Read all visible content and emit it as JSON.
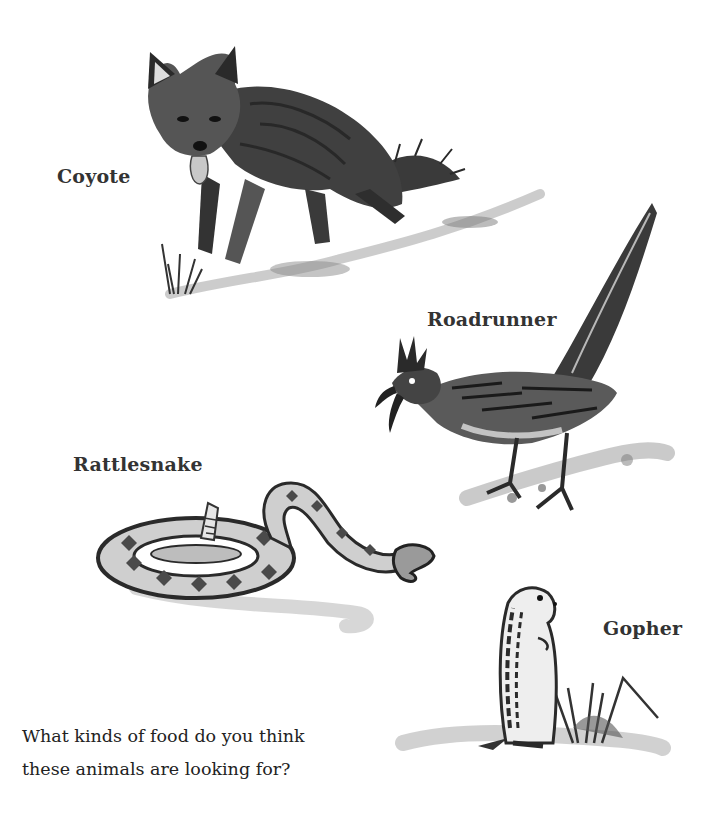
{
  "page": {
    "labels": {
      "coyote": "Coyote",
      "roadrunner": "Roadrunner",
      "rattlesnake": "Rattlesnake",
      "gopher": "Gopher"
    },
    "question": {
      "line1": "What kinds of food do you think",
      "line2": "these animals are looking for?"
    },
    "illustrations": [
      {
        "name": "coyote",
        "icon": "coyote-sketch-icon"
      },
      {
        "name": "roadrunner",
        "icon": "roadrunner-sketch-icon"
      },
      {
        "name": "rattlesnake",
        "icon": "rattlesnake-sketch-icon"
      },
      {
        "name": "gopher",
        "icon": "gopher-sketch-icon"
      }
    ],
    "colors": {
      "ink": "#2a2a2a",
      "shade": "#6b6b6b",
      "light_shade": "#b5b5b5",
      "paper": "#ffffff"
    }
  }
}
